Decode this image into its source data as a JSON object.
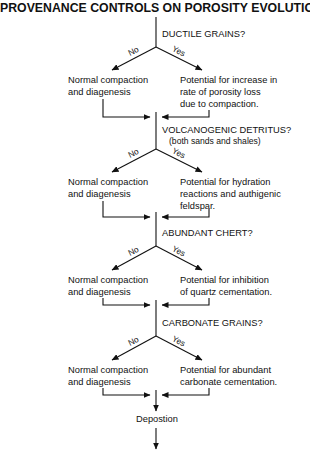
{
  "title": "PROVENANCE CONTROLS ON POROSITY EVOLUTION",
  "decisions": [
    {
      "question": "DUCTILE GRAINS?",
      "subtitle": "",
      "no_label": "No",
      "yes_label": "Yes",
      "no_outcome": "Normal compaction\nand diagenesis",
      "yes_outcome": "Potential for increase in\nrate of porosity loss\ndue to compaction."
    },
    {
      "question": "VOLCANOGENIC DETRITUS?",
      "subtitle": "(both sands and shales)",
      "no_label": "No",
      "yes_label": "Yes",
      "no_outcome": "Normal compaction\nand diagenesis",
      "yes_outcome": "Potential for hydration\nreactions and authigenic\nfeldspar."
    },
    {
      "question": "ABUNDANT CHERT?",
      "subtitle": "",
      "no_label": "No",
      "yes_label": "Yes",
      "no_outcome": "Normal compaction\nand diagenesis",
      "yes_outcome": "Potential for inhibition\nof quartz cementation."
    },
    {
      "question": "CARBONATE GRAINS?",
      "subtitle": "",
      "no_label": "No",
      "yes_label": "Yes",
      "no_outcome": "Normal compaction\nand diagenesis",
      "yes_outcome": "Potential for abundant\ncarbonate cementation."
    }
  ],
  "final_step": "Depostion"
}
